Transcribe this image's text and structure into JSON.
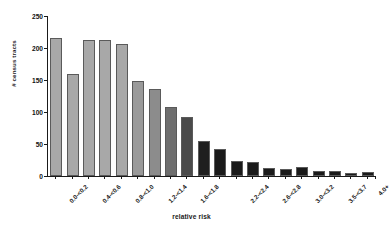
{
  "chart_data": {
    "type": "bar",
    "title": "",
    "xlabel": "relative risk",
    "ylabel": "# census tracts",
    "ylim": [
      0,
      250
    ],
    "yticks": [
      0,
      50,
      100,
      150,
      200,
      250
    ],
    "grid": false,
    "legend": null,
    "categories": [
      "0.0-<0.2",
      "0.2-<0.4",
      "0.4-<0.6",
      "0.6-<0.8",
      "0.8-<1.0",
      "1.0-<1.2",
      "1.2-<1.4",
      "1.4-<1.6",
      "1.6-<1.8",
      "1.8-<2.0",
      "2.0-<2.2",
      "2.2-<2.4",
      "2.4-<2.6",
      "2.6-<2.8",
      "2.8-<3.0",
      "3.0-<3.2",
      "3.2-<3.5",
      "3.5-<3.7",
      "3.7-<4.0",
      "4.0+"
    ],
    "tick_labels_shown": [
      "0.0-<0.2",
      "0.4-<0.6",
      "0.8-<1.0",
      "1.2-<1.4",
      "1.6-<1.8",
      "2.2-<2.4",
      "2.6-<2.8",
      "3.0-<3.2",
      "3.5-<3.7",
      "4.0+"
    ],
    "values": [
      212,
      156,
      210,
      209,
      203,
      145,
      133,
      105,
      89,
      51,
      39,
      21,
      18,
      9,
      8,
      11,
      4,
      4,
      2,
      3
    ],
    "bar_colors": [
      "#a8a8a8",
      "#a8a8a8",
      "#a8a8a8",
      "#a8a8a8",
      "#a8a8a8",
      "#9a9a9a",
      "#8c8c8c",
      "#6e6e6e",
      "#4a4a4a",
      "#1f1f1f",
      "#1a1a1a",
      "#1a1a1a",
      "#1a1a1a",
      "#1a1a1a",
      "#1a1a1a",
      "#1a1a1a",
      "#1a1a1a",
      "#1a1a1a",
      "#1a1a1a",
      "#1a1a1a"
    ],
    "bar_edge_color": "#5a5a5a",
    "axis_color": "#1a1a1a",
    "background": "#ffffff"
  }
}
